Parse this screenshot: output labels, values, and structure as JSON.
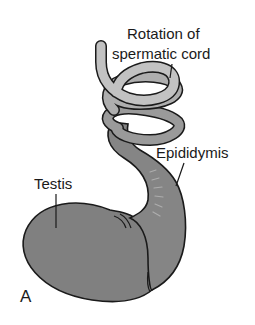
{
  "figure": {
    "panel_letter": "A",
    "labels": {
      "rotation_line1": "Rotation of",
      "rotation_line2": "spermatic cord",
      "epididymis": "Epididymis",
      "testis": "Testis"
    },
    "colors": {
      "cord_light": "#bdbdbd",
      "cord_mid": "#9a9a9a",
      "cord_dark": "#7e7e7e",
      "testis_fill": "#7f7f7f",
      "outline": "#1a1a1a",
      "background": "#ffffff"
    }
  }
}
